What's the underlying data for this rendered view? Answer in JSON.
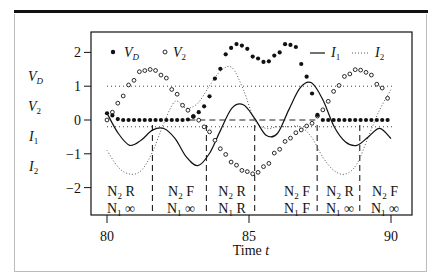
{
  "chart_data": {
    "type": "line",
    "title": "",
    "xlabel": "Time t",
    "ylabel": "",
    "xlim": [
      79.4,
      90.7
    ],
    "ylim": [
      -2.8,
      2.5
    ],
    "x_ticks": [
      80,
      85,
      90
    ],
    "y_ticks": [
      2,
      1,
      0,
      -1,
      -2
    ],
    "y_tick_labels": [
      "2",
      "1",
      "0",
      "−1",
      "−2"
    ],
    "left_variable_labels": [
      "V_D",
      "V_2",
      "I_1",
      "I_2"
    ],
    "grid": false,
    "legend": {
      "position": "top inside",
      "entries": [
        {
          "name": "V_D",
          "marker": "filled-circle"
        },
        {
          "name": "V_2",
          "marker": "open-circle"
        },
        {
          "name": "I_1",
          "style": "solid line"
        },
        {
          "name": "I_2",
          "style": "dotted line"
        }
      ]
    },
    "reference_lines": {
      "horizontal_dotted": [
        1.0,
        -0.2
      ],
      "horizontal_dashed": {
        "y": 0,
        "x_range": [
          82.9,
          87.4
        ]
      },
      "vertical_dashed_t": [
        81.6,
        83.5,
        85.2,
        87.4,
        88.9
      ]
    },
    "regions": [
      {
        "t_range": [
          80.0,
          81.6
        ],
        "N2": "R",
        "N1": "∞"
      },
      {
        "t_range": [
          81.6,
          83.5
        ],
        "N2": "F",
        "N1": "∞"
      },
      {
        "t_range": [
          83.5,
          85.2
        ],
        "N2": "R",
        "N1": "R"
      },
      {
        "t_range": [
          85.2,
          87.4
        ],
        "N2": "F",
        "N1": "F"
      },
      {
        "t_range": [
          87.4,
          88.9
        ],
        "N2": "R",
        "N1": "∞"
      },
      {
        "t_range": [
          88.9,
          90.2
        ],
        "N2": "F",
        "N1": "∞"
      }
    ],
    "series": [
      {
        "name": "V_D",
        "x": [
          80.0,
          80.5,
          81.0,
          81.5,
          82.0,
          82.5,
          82.8,
          83.0,
          83.3,
          83.6,
          83.9,
          84.2,
          84.5,
          84.8,
          85.2,
          85.6,
          86.0,
          86.3,
          86.6,
          86.9,
          87.2,
          87.4,
          87.6,
          88.0,
          88.5,
          89.0,
          89.5,
          90.0
        ],
        "values": [
          0.2,
          0.0,
          0.0,
          0.0,
          0.0,
          0.0,
          0.0,
          0.1,
          0.25,
          0.7,
          1.4,
          1.95,
          2.25,
          2.2,
          1.85,
          1.7,
          1.95,
          2.25,
          2.2,
          1.6,
          0.8,
          0.15,
          0.0,
          0.0,
          0.0,
          0.0,
          0.0,
          0.0
        ]
      },
      {
        "name": "V_2",
        "x": [
          80.0,
          80.4,
          80.8,
          81.2,
          81.6,
          82.0,
          82.4,
          82.8,
          83.2,
          83.6,
          84.0,
          84.4,
          84.8,
          85.2,
          85.6,
          86.0,
          86.4,
          86.8,
          87.2,
          87.6,
          88.0,
          88.4,
          88.8,
          89.2,
          89.6,
          90.0
        ],
        "values": [
          0.0,
          0.5,
          1.05,
          1.45,
          1.5,
          1.3,
          0.8,
          0.3,
          0.0,
          -0.35,
          -0.85,
          -1.25,
          -1.5,
          -1.6,
          -1.35,
          -0.9,
          -0.55,
          -0.3,
          -0.1,
          0.3,
          0.85,
          1.3,
          1.5,
          1.4,
          1.0,
          0.55
        ]
      },
      {
        "name": "I_1",
        "x": [
          80.0,
          80.4,
          80.8,
          81.2,
          81.6,
          82.0,
          82.4,
          82.8,
          83.2,
          83.6,
          84.0,
          84.4,
          84.8,
          85.2,
          85.6,
          86.0,
          86.4,
          86.8,
          87.2,
          87.6,
          88.0,
          88.4,
          88.8,
          89.2,
          89.6,
          90.0
        ],
        "values": [
          0.2,
          -0.4,
          -0.75,
          -0.6,
          -0.3,
          -0.25,
          -0.55,
          -1.1,
          -1.35,
          -1.0,
          -0.3,
          0.35,
          0.45,
          0.05,
          -0.45,
          -0.4,
          0.3,
          0.95,
          1.1,
          0.6,
          -0.2,
          -0.65,
          -0.75,
          -0.5,
          -0.25,
          -0.55
        ]
      },
      {
        "name": "I_2",
        "x": [
          80.0,
          80.4,
          80.8,
          81.2,
          81.6,
          82.0,
          82.4,
          82.8,
          83.2,
          83.6,
          84.0,
          84.4,
          84.8,
          85.2,
          85.6,
          86.0,
          86.4,
          86.8,
          87.2,
          87.6,
          88.0,
          88.4,
          88.8,
          89.2,
          89.6,
          90.0
        ],
        "values": [
          -0.9,
          -1.4,
          -1.6,
          -1.5,
          -0.95,
          -0.1,
          0.55,
          0.35,
          0.5,
          1.0,
          1.45,
          1.55,
          0.9,
          0.0,
          -0.25,
          -0.2,
          -0.2,
          -0.2,
          -0.5,
          -1.1,
          -1.5,
          -1.6,
          -1.3,
          -0.5,
          0.3,
          0.9
        ]
      }
    ]
  }
}
